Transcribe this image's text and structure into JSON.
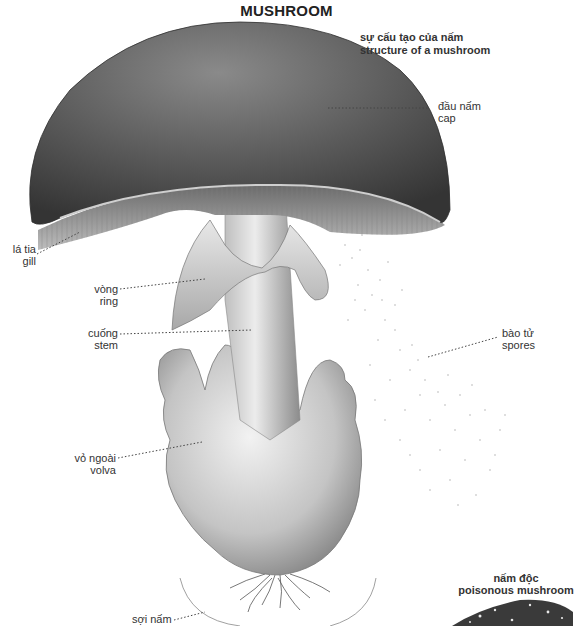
{
  "title": "MUSHROOM",
  "subtitle": {
    "line1": "sự cấu tạo của nấm",
    "line2": "structure of a mushroom"
  },
  "labels": {
    "cap": {
      "vi": "đầu nấm",
      "en": "cap"
    },
    "gill": {
      "vi": "lá tia",
      "en": "gill"
    },
    "ring": {
      "vi": "vòng",
      "en": "ring"
    },
    "stem": {
      "vi": "cuống",
      "en": "stem"
    },
    "spores": {
      "vi": "bào tử",
      "en": "spores"
    },
    "volva": {
      "vi": "vỏ ngoài",
      "en": "volva"
    },
    "mycelium": {
      "vi": "sợi nấm",
      "en": ""
    }
  },
  "inset": {
    "vi": "nấm độc",
    "en": "poisonous mushroom"
  },
  "colors": {
    "cap_dark": "#3c3c3c",
    "cap_mid": "#6e6e6e",
    "gill": "#9a9a9a",
    "stem": "#d6d6d6",
    "leader": "#444444"
  }
}
